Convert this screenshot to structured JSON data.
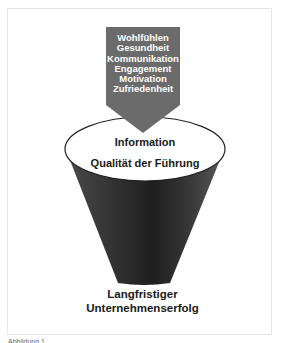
{
  "figure": {
    "arrow": {
      "items": [
        "Wohlfühlen",
        "Gesundheit",
        "Kommunikation",
        "Engagement",
        "Motivation",
        "Zufriedenheit"
      ],
      "fill_color": "#6b6b6b"
    },
    "funnel_top": {
      "line1": "Information",
      "line2": "Qualität der Führung"
    },
    "funnel_bottom": {
      "line1": "Langfristiger",
      "line2": "Unternehmenserfolg"
    },
    "caption": "Abbildung 1"
  }
}
